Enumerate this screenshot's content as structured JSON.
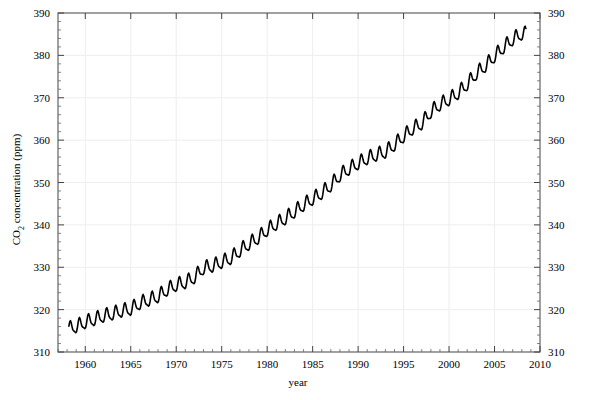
{
  "chart_data": {
    "type": "line",
    "title": "",
    "xlabel": "year",
    "ylabel_prefix": "CO",
    "ylabel_sub": "2",
    "ylabel_suffix": " concentration (ppm)",
    "ylabel_full": "CO2 concentration (ppm)",
    "xlim": [
      1957.0,
      2010.0
    ],
    "ylim": [
      310,
      390
    ],
    "x_major_ticks": [
      1960,
      1965,
      1970,
      1975,
      1980,
      1985,
      1990,
      1995,
      2000,
      2005,
      2010
    ],
    "x_tick_labels": [
      "1960",
      "1965",
      "1970",
      "1975",
      "1980",
      "1985",
      "1990",
      "1995",
      "2000",
      "2005",
      "2010"
    ],
    "x_minor_interval": 1,
    "y_major_ticks": [
      310,
      320,
      330,
      340,
      350,
      360,
      370,
      380,
      390
    ],
    "y_tick_labels": [
      "310",
      "320",
      "330",
      "340",
      "350",
      "360",
      "370",
      "380",
      "390"
    ],
    "y_minor_interval": 2,
    "grid": true,
    "grid_color": "#eeeeee",
    "legend": null,
    "line_color": "#000000",
    "line_width": 1.6,
    "series_name": "Mauna Loa monthly mean CO2",
    "annual_mean": {
      "x": [
        1958,
        1959,
        1960,
        1961,
        1962,
        1963,
        1964,
        1965,
        1966,
        1967,
        1968,
        1969,
        1970,
        1971,
        1972,
        1973,
        1974,
        1975,
        1976,
        1977,
        1978,
        1979,
        1980,
        1981,
        1982,
        1983,
        1984,
        1985,
        1986,
        1987,
        1988,
        1989,
        1990,
        1991,
        1992,
        1993,
        1994,
        1995,
        1996,
        1997,
        1998,
        1999,
        2000,
        2001,
        2002,
        2003,
        2004,
        2005,
        2006,
        2007,
        2008
      ],
      "y": [
        315.3,
        315.9,
        316.9,
        317.6,
        318.4,
        318.9,
        319.6,
        320.0,
        321.4,
        322.2,
        323.0,
        324.6,
        325.7,
        326.3,
        327.5,
        329.7,
        330.2,
        331.1,
        332.0,
        333.8,
        335.4,
        336.8,
        338.7,
        340.1,
        341.4,
        343.0,
        344.6,
        346.0,
        347.4,
        349.2,
        351.6,
        353.1,
        354.4,
        355.6,
        356.4,
        357.1,
        358.8,
        360.8,
        362.6,
        363.8,
        366.6,
        368.3,
        369.5,
        371.0,
        373.1,
        375.6,
        377.4,
        379.7,
        381.8,
        383.7,
        385.0
      ],
      "units": "ppm"
    },
    "seasonal_amplitude_ppm": 3.0,
    "seasonal_peak_month": 5,
    "data_start_year": 1958.2,
    "data_end_year": 2008.5,
    "value_at_start": 315.3,
    "value_at_end": 385.0,
    "notes": [
      "plateau near 1973-1975",
      "plateau near 1992-1993",
      "plateau near 1999-2000"
    ]
  }
}
